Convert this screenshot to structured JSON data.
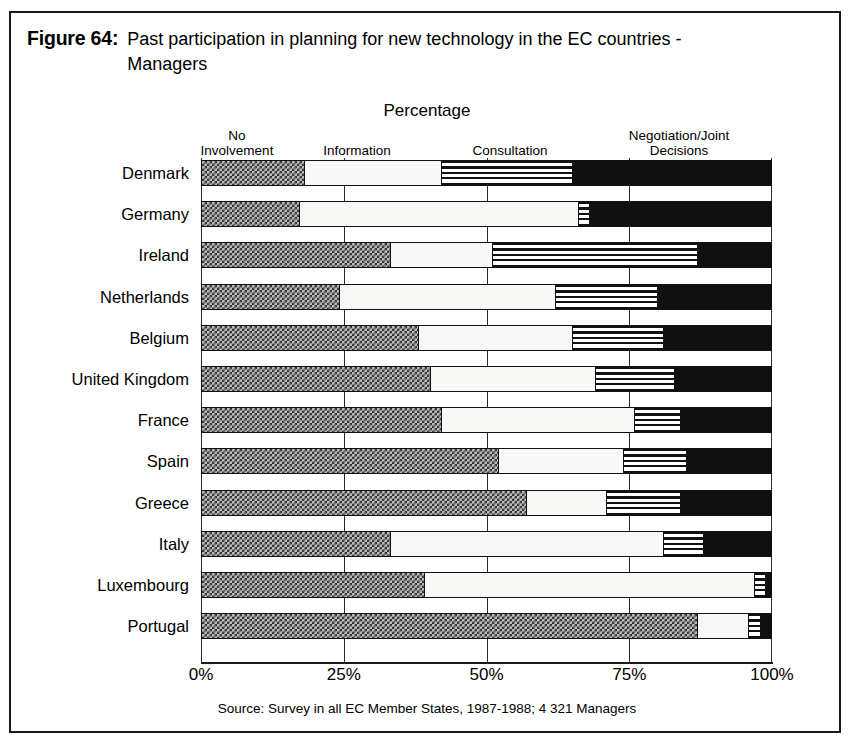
{
  "figure": {
    "label": "Figure 64:",
    "caption": "Past participation in planning for new technology in the EC countries - Managers"
  },
  "chart_title": "Percentage",
  "source_note": "Source: Survey in all EC Member States, 1987-1988; 4 321 Managers",
  "legend": [
    {
      "label": "No\nInvolvement",
      "line1": "No",
      "line2": "Involvement",
      "swatch": "checker-gray"
    },
    {
      "label": "Information",
      "line1": "Information",
      "line2": "",
      "swatch": "white"
    },
    {
      "label": "Consultation",
      "line1": "Consultation",
      "line2": "",
      "swatch": "horizontal-stripes"
    },
    {
      "label": "Negotiation/Joint Decisions",
      "line1": "Negotiation/Joint",
      "line2": "Decisions",
      "swatch": "black"
    }
  ],
  "axis": {
    "ticks": [
      "0%",
      "25%",
      "50%",
      "75%",
      "100%"
    ],
    "tick_values": [
      0,
      25,
      50,
      75,
      100
    ],
    "xmin": 0,
    "xmax": 100
  },
  "chart_data": {
    "type": "bar",
    "orientation": "horizontal",
    "stacked": true,
    "normalized_percent": true,
    "title": "Percentage",
    "xlabel": "Percentage",
    "ylabel": "",
    "xlim": [
      0,
      100
    ],
    "grid": true,
    "legend_position": "top",
    "categories": [
      "Denmark",
      "Germany",
      "Ireland",
      "Netherlands",
      "Belgium",
      "United Kingdom",
      "France",
      "Spain",
      "Greece",
      "Italy",
      "Luxembourg",
      "Portugal"
    ],
    "series": [
      {
        "name": "No Involvement",
        "values": [
          18,
          17,
          33,
          24,
          38,
          40,
          42,
          52,
          57,
          33,
          39,
          87
        ]
      },
      {
        "name": "Information",
        "values": [
          24,
          49,
          18,
          38,
          27,
          29,
          34,
          22,
          14,
          48,
          58,
          9
        ]
      },
      {
        "name": "Consultation",
        "values": [
          23,
          2,
          36,
          18,
          16,
          14,
          8,
          11,
          13,
          7,
          2,
          2
        ]
      },
      {
        "name": "Negotiation/Joint Decisions",
        "values": [
          35,
          32,
          13,
          20,
          19,
          17,
          16,
          15,
          16,
          12,
          1,
          2
        ]
      }
    ]
  }
}
